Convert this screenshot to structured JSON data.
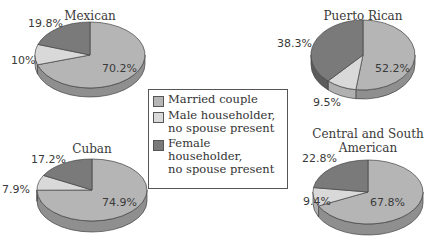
{
  "chart_data": [
    {
      "type": "pie",
      "title": "Mexican",
      "categories": [
        "Married couple",
        "Male householder, no spouse present",
        "Female householder, no spouse present"
      ],
      "values": [
        70.2,
        10,
        19.8
      ],
      "labels": [
        "70.2%",
        "10%",
        "19.8%"
      ]
    },
    {
      "type": "pie",
      "title": "Puerto Rican",
      "categories": [
        "Married couple",
        "Male householder, no spouse present",
        "Female householder, no spouse present"
      ],
      "values": [
        52.2,
        9.5,
        38.3
      ],
      "labels": [
        "52.2%",
        "9.5%",
        "38.3%"
      ]
    },
    {
      "type": "pie",
      "title": "Cuban",
      "categories": [
        "Married couple",
        "Male householder, no spouse present",
        "Female householder, no spouse present"
      ],
      "values": [
        74.9,
        7.9,
        17.2
      ],
      "labels": [
        "74.9%",
        "7.9%",
        "17.2%"
      ]
    },
    {
      "type": "pie",
      "title": "Central and South American",
      "categories": [
        "Married couple",
        "Male householder, no spouse present",
        "Female householder, no spouse present"
      ],
      "values": [
        67.8,
        9.4,
        22.8
      ],
      "labels": [
        "67.8%",
        "9.4%",
        "22.8%"
      ]
    }
  ],
  "legend": {
    "items": [
      {
        "label": "Married couple",
        "color": "#b5b5b5"
      },
      {
        "label": "Male householder,\nno spouse present",
        "color": "#d9d9d9"
      },
      {
        "label": "Female householder,\nno spouse present",
        "color": "#7a7a7a"
      }
    ]
  },
  "titles": {
    "mexican": "Mexican",
    "puerto_rican": "Puerto Rican",
    "cuban": "Cuban",
    "csa_line1": "Central and South",
    "csa_line2": "American"
  },
  "labels": {
    "mexican": {
      "married": "70.2%",
      "male": "10%",
      "female": "19.8%"
    },
    "puerto_rican": {
      "married": "52.2%",
      "male": "9.5%",
      "female": "38.3%"
    },
    "cuban": {
      "married": "74.9%",
      "male": "7.9%",
      "female": "17.2%"
    },
    "csa": {
      "married": "67.8%",
      "male": "9.4%",
      "female": "22.8%"
    }
  }
}
